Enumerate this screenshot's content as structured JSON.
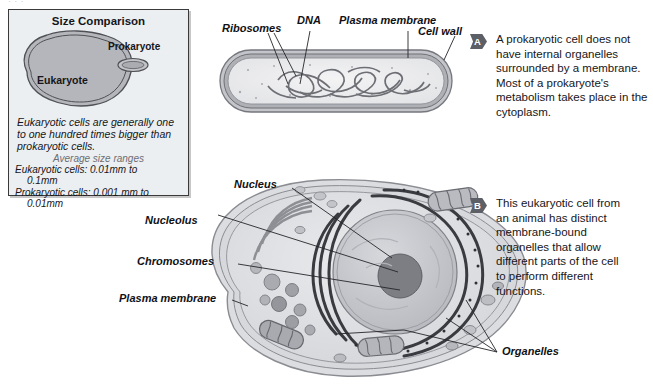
{
  "top_strip_text": "· · ·",
  "size_panel": {
    "title": "Size Comparison",
    "eukaryote_label": "Eukaryote",
    "prokaryote_label": "Prokaryote",
    "note": "Eukaryotic cells are generally one to one hundred times bigger than prokaryotic cells.",
    "avg_heading": "Average size ranges",
    "avg_eukaryotic": "Eukaryotic cells: 0.01mm to",
    "avg_eukaryotic_cont": "0.1mm",
    "avg_prokaryotic": "Prokaryotic cells: 0.001 mm to",
    "avg_prokaryotic_cont": "0.01mm"
  },
  "prokaryote_diagram": {
    "labels": {
      "ribosomes": "Ribosomes",
      "dna": "DNA",
      "plasma_membrane": "Plasma membrane",
      "cell_wall": "Cell wall"
    }
  },
  "eukaryote_diagram": {
    "labels": {
      "nucleus": "Nucleus",
      "nucleolus": "Nucleolus",
      "chromosomes": "Chromosomes",
      "plasma_membrane": "Plasma membrane",
      "organelles": "Organelles"
    }
  },
  "callouts": [
    {
      "badge": "A",
      "text": "A prokaryotic cell does not have internal organelles surrounded by a membrane. Most of a prokaryote's metabolism takes place in the cytoplasm."
    },
    {
      "badge": "B",
      "text": "This eukaryotic cell from an animal has distinct membrane-bound organelles that allow different parts of the cell to perform different functions."
    }
  ],
  "colors": {
    "panel_bg": "#eceff1",
    "panel_border": "#3a3a3a",
    "badge": "#5d5f66",
    "text": "#16161a",
    "cell_fill": "#d9dadd",
    "cell_outline": "#8a8c92",
    "nucleus": "#b9bbc0",
    "nucleolus": "#7e8086"
  }
}
